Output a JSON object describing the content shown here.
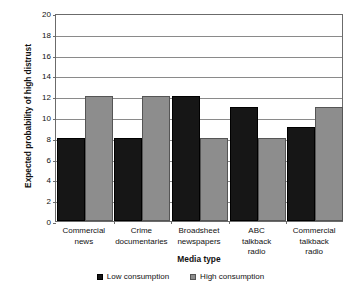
{
  "chart_data": {
    "type": "bar",
    "title": "",
    "xlabel": "Media type",
    "ylabel": "Expected probability of high distrust",
    "categories": [
      "Commercial news",
      "Crime documentaries",
      "Broadsheet newspapers",
      "ABC talkback radio",
      "Commercial talkback radio"
    ],
    "category_lines": [
      [
        "Commercial",
        "news"
      ],
      [
        "Crime",
        "documentaries"
      ],
      [
        "Broadsheet",
        "newspapers"
      ],
      [
        "ABC",
        "talkback",
        "radio"
      ],
      [
        "Commercial",
        "talkback",
        "radio"
      ]
    ],
    "series": [
      {
        "name": "Low consumption",
        "color": "#161616",
        "values": [
          8,
          8,
          12,
          11,
          9
        ]
      },
      {
        "name": "High consumption",
        "color": "#8d8d8d",
        "values": [
          12,
          12,
          8,
          8,
          11
        ]
      }
    ],
    "ylim": [
      0,
      20
    ],
    "yticks": [
      0,
      2,
      4,
      6,
      8,
      10,
      12,
      14,
      16,
      18,
      20
    ],
    "ytick_labels": [
      "0",
      "2",
      "4",
      "6",
      "8",
      "10",
      "12",
      "14",
      "16",
      "18",
      "20"
    ],
    "grid": true,
    "grid_axis": "y",
    "legend_position": "bottom"
  },
  "legend": {
    "items": [
      {
        "label": "Low consumption",
        "marker": "square-black-icon"
      },
      {
        "label": "High consumption",
        "marker": "square-gray-icon"
      }
    ]
  }
}
